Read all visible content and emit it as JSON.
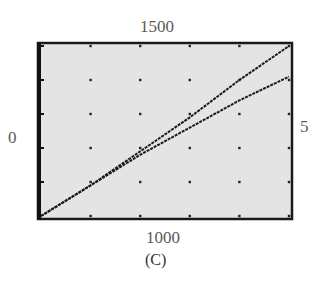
{
  "figure": {
    "caption": "(C)",
    "window_labels": {
      "top": "1500",
      "bottom": "1000",
      "left": "0",
      "right": "5"
    }
  },
  "chart_data": {
    "type": "line",
    "title": "",
    "xlabel": "",
    "ylabel": "",
    "xlim": [
      0,
      5
    ],
    "ylim": [
      1000,
      1500
    ],
    "grid": "dots",
    "grid_x": [
      1,
      2,
      3,
      4,
      5
    ],
    "grid_y": [
      1100,
      1200,
      1300,
      1400,
      1500
    ],
    "series": [
      {
        "name": "curve-upper",
        "x": [
          0,
          1,
          2,
          3,
          4,
          5
        ],
        "y": [
          1000,
          1090,
          1190,
          1290,
          1400,
          1500
        ]
      },
      {
        "name": "curve-lower",
        "x": [
          0,
          1,
          2,
          3,
          4,
          5
        ],
        "y": [
          1000,
          1090,
          1180,
          1260,
          1340,
          1410
        ]
      }
    ],
    "colors": {
      "background": "#e4e4e4",
      "frame": "#1a1a1a",
      "line": "#1a1a1a",
      "dots": "#222222"
    }
  }
}
